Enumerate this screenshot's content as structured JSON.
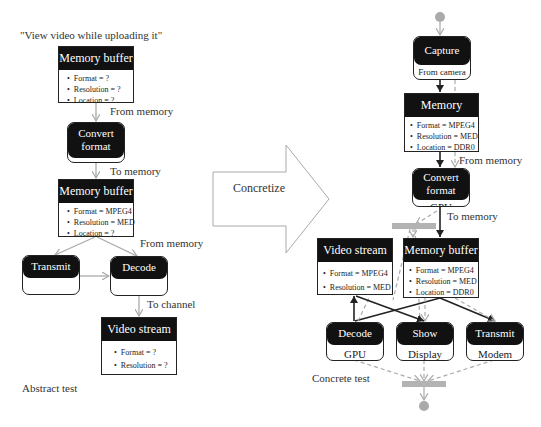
{
  "abstract": {
    "title": "\"View video while uploading it\"",
    "caption": "Abstract test",
    "memory_buffer_1": {
      "title": "Memory buffer",
      "props": [
        "Format = ?",
        "Resolution = ?",
        "Location = ?"
      ]
    },
    "edge_from_memory_1": "From memory",
    "convert_format": {
      "title_line1": "Convert",
      "title_line2": "format",
      "footer": ""
    },
    "edge_to_memory": "To memory",
    "memory_buffer_2": {
      "title": "Memory buffer",
      "props": [
        "Format = MPEG4",
        "Resolution = MED",
        "Location = ?"
      ]
    },
    "edge_from_memory_2": "From memory",
    "transmit": {
      "title": "Transmit",
      "footer": ""
    },
    "decode": {
      "title": "Decode",
      "footer": ""
    },
    "edge_to_channel": "To channel",
    "video_stream": {
      "title": "Video stream",
      "props": [
        "Format = ?",
        "Resolution = ?"
      ]
    }
  },
  "transform": {
    "label": "Concretize"
  },
  "concrete": {
    "caption": "Concrete test",
    "capture": {
      "title": "Capture",
      "footer": "From camera"
    },
    "memory_buffer_1": {
      "title": "Memory buffer",
      "props": [
        "Format = MPEG4",
        "Resolution = MED",
        "Location = DDR0"
      ]
    },
    "edge_from_memory": "From memory",
    "convert_format": {
      "title_line1": "Convert",
      "title_line2": "format",
      "footer": "GPU"
    },
    "edge_to_memory": "To memory",
    "video_stream": {
      "title": "Video stream",
      "props": [
        "Format = MPEG4",
        "Resolution = MED"
      ]
    },
    "memory_buffer_2": {
      "title": "Memory buffer",
      "props": [
        "Format = MPEG4",
        "Resolution = MED",
        "Location = DDR0"
      ]
    },
    "decode": {
      "title": "Decode",
      "footer": "GPU"
    },
    "show": {
      "title": "Show",
      "footer": "Display"
    },
    "transmit": {
      "title": "Transmit",
      "footer": "Modem"
    }
  },
  "colors": {
    "node_header": "#111111",
    "gray_edge": "#aaaaaa",
    "black_edge": "#222222",
    "sync_bar": "#b3b3b3"
  }
}
